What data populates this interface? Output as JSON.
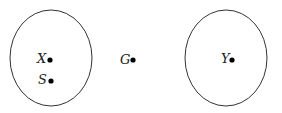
{
  "diagram": {
    "regions": [
      {
        "id": "left-region",
        "cx": 51,
        "cy": 58,
        "rx": 41,
        "ry": 48
      },
      {
        "id": "right-region",
        "cx": 226,
        "cy": 58,
        "rx": 41,
        "ry": 48
      }
    ],
    "points": [
      {
        "label": "X",
        "x": 50,
        "y": 59
      },
      {
        "label": "S",
        "x": 51,
        "y": 80
      },
      {
        "label": "G",
        "x": 133,
        "y": 60
      },
      {
        "label": "Y",
        "x": 232,
        "y": 59
      }
    ],
    "stroke_color": "#333333",
    "point_color": "#000000"
  }
}
